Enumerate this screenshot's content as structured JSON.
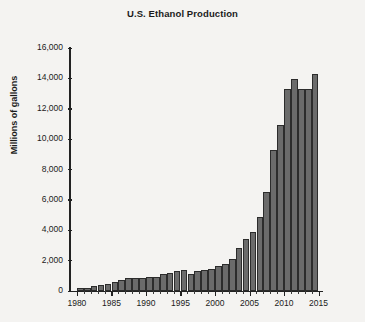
{
  "chart_data": {
    "type": "bar",
    "title": "U.S. Ethanol Production",
    "xlabel": "",
    "ylabel": "Millions of gallons",
    "xlim": [
      1979,
      2015.5
    ],
    "ylim": [
      0,
      16000
    ],
    "grid": false,
    "legend": null,
    "bar_color": "#6b6b6b",
    "bar_edge_color": "#2c2c2c",
    "background_color": "#f4f3f1",
    "ytick_labels": [
      "16,000",
      "14,000",
      "12,000",
      "10,000",
      "8,000",
      "6,000",
      "4,000",
      "2,000",
      "0"
    ],
    "ytick_values": [
      16000,
      14000,
      12000,
      10000,
      8000,
      6000,
      4000,
      2000,
      0
    ],
    "xtick_labels": [
      "1980",
      "1985",
      "1990",
      "1995",
      "2000",
      "2005",
      "2010",
      "2015"
    ],
    "xtick_values": [
      1980,
      1985,
      1990,
      1995,
      2000,
      2005,
      2010,
      2015
    ],
    "categories": [
      1980,
      1981,
      1982,
      1983,
      1984,
      1985,
      1986,
      1987,
      1988,
      1989,
      1990,
      1991,
      1992,
      1993,
      1994,
      1995,
      1996,
      1997,
      1998,
      1999,
      2000,
      2001,
      2002,
      2003,
      2004,
      2005,
      2006,
      2007,
      2008,
      2009,
      2010,
      2011,
      2012,
      2013,
      2014
    ],
    "values": [
      175,
      215,
      350,
      375,
      430,
      610,
      710,
      830,
      845,
      870,
      900,
      950,
      1100,
      1200,
      1350,
      1400,
      1100,
      1300,
      1400,
      1470,
      1630,
      1770,
      2130,
      2800,
      3400,
      3904,
      4884,
      6500,
      9309,
      10938,
      13298,
      13948,
      13300,
      13300,
      14300
    ]
  }
}
